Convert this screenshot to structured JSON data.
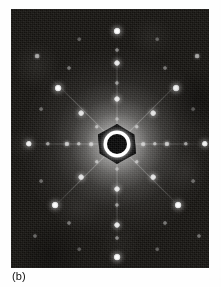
{
  "figure": {
    "caption_label": "(b)",
    "panel": {
      "x": 11,
      "y": 9,
      "width": 198,
      "height": 259,
      "background_color": "#14120f",
      "description_name": "diffraction-pattern-photograph"
    },
    "page_background": "#ffffff",
    "ink_color": "#101010"
  },
  "pattern": {
    "type": "electron-diffraction",
    "symmetry": "4-fold",
    "center": {
      "x": 106,
      "y": 135
    },
    "beam_stop": {
      "shape": "hexagon",
      "hex_width": 38,
      "hex_height": 40,
      "ring_diameter": 27,
      "core_diameter": 20,
      "hex_color": "#0a0a0a",
      "ring_color": "#ffffff",
      "core_color": "#070707"
    },
    "halo": {
      "diameter": 190,
      "peak_color": "#ffffff"
    },
    "streaks": [
      {
        "name": "streak-horizontal",
        "length": 176,
        "angle": 0
      },
      {
        "name": "streak-vertical",
        "length": 210,
        "angle": 90
      },
      {
        "name": "streak-diagonal-a",
        "length": 190,
        "angle": 45
      },
      {
        "name": "streak-diagonal-b",
        "length": 190,
        "angle": -45
      }
    ],
    "spots": [
      {
        "x": 106,
        "y": 22,
        "r": 3.4,
        "i": 1.0
      },
      {
        "x": 106,
        "y": 41,
        "r": 2.0,
        "i": 0.45
      },
      {
        "x": 106,
        "y": 54,
        "r": 3.0,
        "i": 0.92
      },
      {
        "x": 106,
        "y": 74,
        "r": 2.1,
        "i": 0.5
      },
      {
        "x": 106,
        "y": 90,
        "r": 3.0,
        "i": 0.9
      },
      {
        "x": 106,
        "y": 110,
        "r": 2.0,
        "i": 0.42
      },
      {
        "x": 106,
        "y": 160,
        "r": 2.0,
        "i": 0.42
      },
      {
        "x": 106,
        "y": 180,
        "r": 3.0,
        "i": 0.9
      },
      {
        "x": 106,
        "y": 196,
        "r": 2.1,
        "i": 0.5
      },
      {
        "x": 106,
        "y": 216,
        "r": 3.0,
        "i": 0.92
      },
      {
        "x": 106,
        "y": 229,
        "r": 2.0,
        "i": 0.45
      },
      {
        "x": 106,
        "y": 248,
        "r": 3.4,
        "i": 1.0
      },
      {
        "x": 18,
        "y": 135,
        "r": 3.2,
        "i": 0.95
      },
      {
        "x": 37,
        "y": 135,
        "r": 2.2,
        "i": 0.55
      },
      {
        "x": 56,
        "y": 135,
        "r": 2.6,
        "i": 0.72
      },
      {
        "x": 68,
        "y": 135,
        "r": 2.2,
        "i": 0.58
      },
      {
        "x": 80,
        "y": 135,
        "r": 2.3,
        "i": 0.62
      },
      {
        "x": 132,
        "y": 135,
        "r": 2.3,
        "i": 0.62
      },
      {
        "x": 144,
        "y": 135,
        "r": 2.2,
        "i": 0.58
      },
      {
        "x": 156,
        "y": 135,
        "r": 2.6,
        "i": 0.72
      },
      {
        "x": 175,
        "y": 135,
        "r": 2.2,
        "i": 0.55
      },
      {
        "x": 194,
        "y": 135,
        "r": 3.2,
        "i": 0.95
      },
      {
        "x": 47,
        "y": 79,
        "r": 3.4,
        "i": 1.0
      },
      {
        "x": 165,
        "y": 79,
        "r": 3.4,
        "i": 1.0
      },
      {
        "x": 44,
        "y": 196,
        "r": 3.4,
        "i": 1.0
      },
      {
        "x": 167,
        "y": 196,
        "r": 3.4,
        "i": 1.0
      },
      {
        "x": 70,
        "y": 104,
        "r": 2.9,
        "i": 0.88
      },
      {
        "x": 142,
        "y": 104,
        "r": 2.9,
        "i": 0.88
      },
      {
        "x": 70,
        "y": 168,
        "r": 2.9,
        "i": 0.88
      },
      {
        "x": 142,
        "y": 168,
        "r": 2.9,
        "i": 0.88
      },
      {
        "x": 86,
        "y": 118,
        "r": 2.2,
        "i": 0.55
      },
      {
        "x": 126,
        "y": 118,
        "r": 2.2,
        "i": 0.55
      },
      {
        "x": 86,
        "y": 153,
        "r": 2.2,
        "i": 0.55
      },
      {
        "x": 126,
        "y": 153,
        "r": 2.2,
        "i": 0.55
      },
      {
        "x": 58,
        "y": 59,
        "r": 2.0,
        "i": 0.4
      },
      {
        "x": 154,
        "y": 59,
        "r": 2.0,
        "i": 0.4
      },
      {
        "x": 58,
        "y": 214,
        "r": 2.0,
        "i": 0.4
      },
      {
        "x": 154,
        "y": 214,
        "r": 2.0,
        "i": 0.4
      },
      {
        "x": 26,
        "y": 47,
        "r": 2.4,
        "i": 0.62
      },
      {
        "x": 186,
        "y": 47,
        "r": 2.4,
        "i": 0.62
      },
      {
        "x": 24,
        "y": 227,
        "r": 2.0,
        "i": 0.38
      },
      {
        "x": 188,
        "y": 227,
        "r": 2.0,
        "i": 0.38
      },
      {
        "x": 68,
        "y": 30,
        "r": 1.8,
        "i": 0.3
      },
      {
        "x": 146,
        "y": 30,
        "r": 1.8,
        "i": 0.3
      },
      {
        "x": 68,
        "y": 240,
        "r": 1.8,
        "i": 0.3
      },
      {
        "x": 146,
        "y": 240,
        "r": 1.8,
        "i": 0.3
      },
      {
        "x": 30,
        "y": 100,
        "r": 1.9,
        "i": 0.34
      },
      {
        "x": 182,
        "y": 100,
        "r": 1.9,
        "i": 0.34
      },
      {
        "x": 30,
        "y": 172,
        "r": 1.9,
        "i": 0.34
      },
      {
        "x": 182,
        "y": 172,
        "r": 1.9,
        "i": 0.34
      }
    ]
  }
}
